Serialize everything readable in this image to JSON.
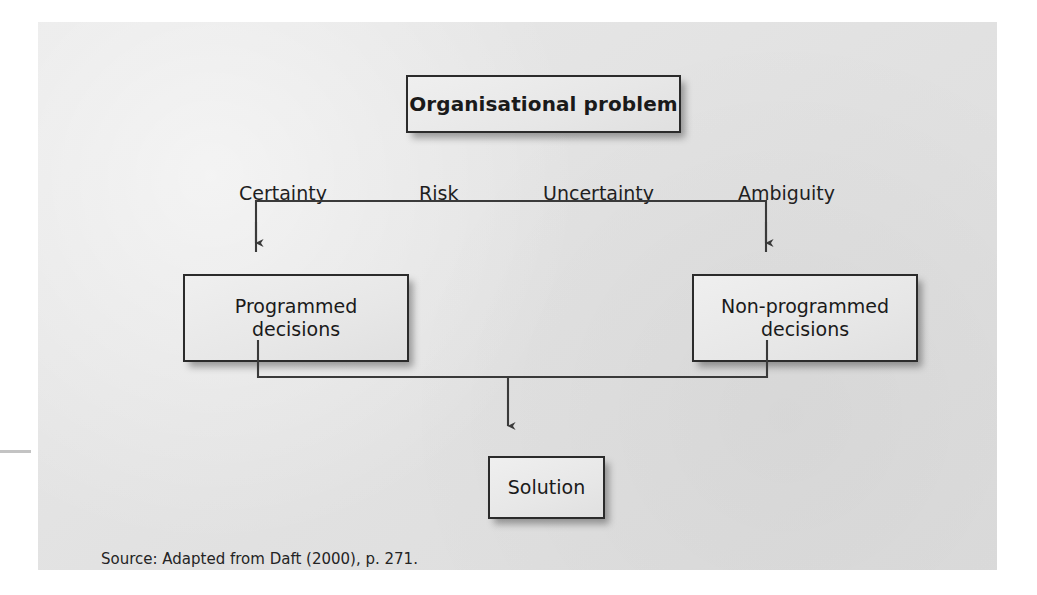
{
  "figure": {
    "nodes": {
      "problem": "Organisational problem",
      "programmed": "Programmed\ndecisions",
      "programmed_line1": "Programmed",
      "programmed_line2": "decisions",
      "nonprogrammed_line1": "Non-programmed",
      "nonprogrammed_line2": "decisions",
      "solution": "Solution"
    },
    "continuum_labels": [
      "Certainty",
      "Risk",
      "Uncertainty",
      "Ambiguity"
    ],
    "source": "Source: Adapted from Daft (2000), p. 271.",
    "colors": {
      "panel_background": "#e3e3e3",
      "page_background": "#ffffff",
      "box_fill": "#e8e8e8",
      "box_border": "#2b2b2b",
      "connector": "#3a3a3a",
      "text": "#1a1a1a"
    },
    "connector_paths": {
      "top_bracket": "M 256 252 L 256 200 L 766 200 L 766 252",
      "bottom_bracket": "M 258 340 L 258 377 L 767 377 L 767 340",
      "solution_stem": "M 508 377 L 508 434"
    }
  }
}
